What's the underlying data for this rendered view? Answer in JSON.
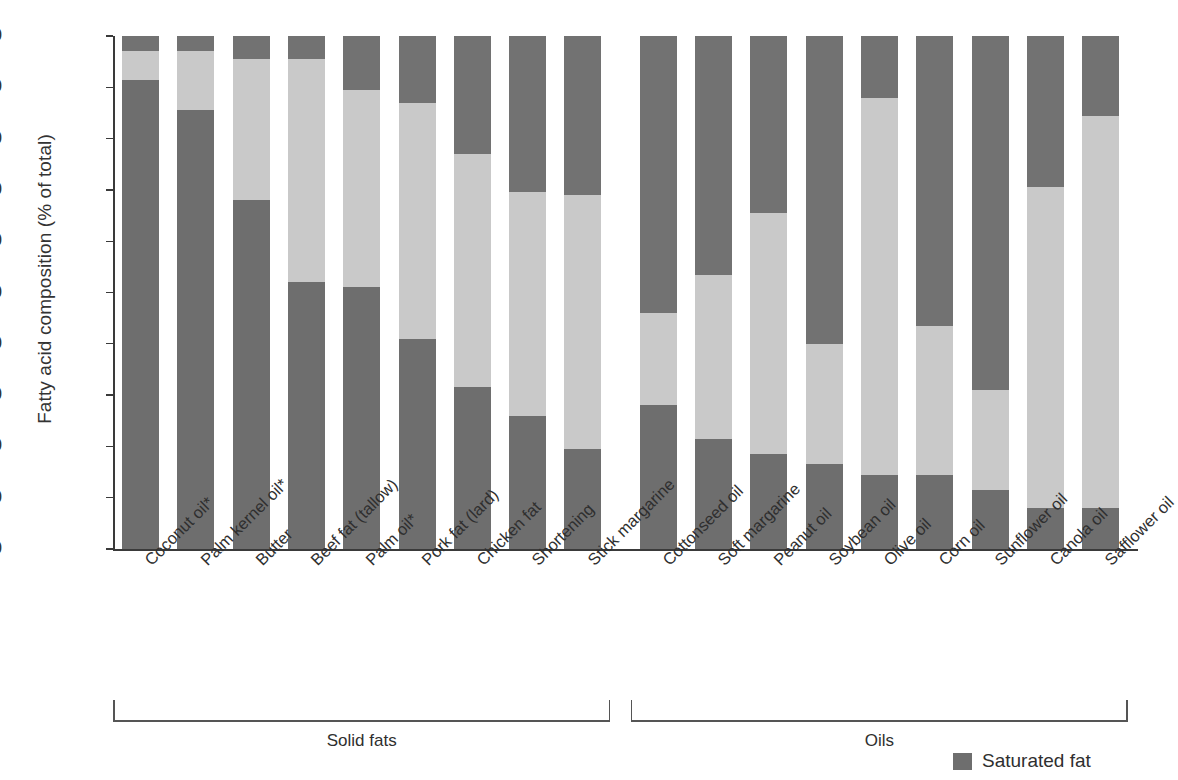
{
  "chart_data": {
    "type": "bar",
    "subtype": "stacked-bar-100",
    "title": "",
    "xlabel": "",
    "ylabel": "Fatty acid composition (% of total)",
    "ylim": [
      0,
      100
    ],
    "yticks": [
      0,
      10,
      20,
      30,
      40,
      50,
      60,
      70,
      80,
      90,
      100
    ],
    "ytick_labels": [
      "0",
      "10",
      "20",
      "30",
      "40",
      "50",
      "60",
      "70",
      "80",
      "90",
      "100"
    ],
    "grid": false,
    "legend_position": "bottom-right",
    "categories": [
      "Coconut oil*",
      "Palm kernel oil*",
      "Butter",
      "Beef fat (tallow)",
      "Palm oil*",
      "Pork fat (lard)",
      "Chicken fat",
      "Shortening",
      "Stick margarine",
      "Cottonseed oil",
      "Soft margarine",
      "Peanut oil",
      "Soybean oil",
      "Olive oil",
      "Corn oil",
      "Sunflower oil",
      "Canola oil",
      "Safflower oil"
    ],
    "series": [
      {
        "name": "Saturated fat",
        "color": "#6e6e6e",
        "values": [
          91.5,
          85.5,
          68,
          52,
          51,
          41,
          31.5,
          26,
          19.5,
          28,
          21.5,
          18.5,
          16.5,
          14.5,
          14.5,
          11.5,
          8,
          8
        ]
      },
      {
        "name": "Monounsaturated fat",
        "color": "#c9c9c9",
        "values": [
          5.5,
          11.5,
          27.5,
          43.5,
          38.5,
          46,
          45.5,
          43.5,
          49.5,
          18,
          32,
          47,
          23.5,
          73.5,
          29,
          19.5,
          62.5,
          76.5
        ]
      },
      {
        "name": "Polyunsaturated fat",
        "color": "#727272",
        "values": [
          3,
          3,
          4.5,
          4.5,
          10.5,
          13,
          23,
          30.5,
          31,
          54,
          46.5,
          34.5,
          60,
          12,
          56.5,
          69,
          29.5,
          15.5
        ]
      }
    ],
    "segment_boundaries_pct": {
      "note": "cumulative upper edge of saturated, then of saturated+mono",
      "sat_top": [
        91.5,
        85.5,
        68,
        52,
        51,
        41,
        31.5,
        26,
        19.5,
        28,
        21.5,
        18.5,
        16.5,
        14.5,
        14.5,
        11.5,
        8,
        8
      ],
      "mono_top": [
        97,
        97,
        95.5,
        95.5,
        89.5,
        87,
        77,
        69.5,
        69,
        46,
        53.5,
        65.5,
        40,
        88,
        43.5,
        31,
        70.5,
        84.5
      ]
    },
    "groups": [
      {
        "label": "Solid fats",
        "start_index": 0,
        "end_index": 8
      },
      {
        "label": "Oils",
        "start_index": 9,
        "end_index": 17
      }
    ],
    "legend": [
      {
        "label": "Saturated fat",
        "color": "#6e6e6e"
      }
    ],
    "footnote_marker": "*",
    "colors": {
      "saturated": "#6e6e6e",
      "monounsaturated": "#c9c9c9",
      "polyunsaturated": "#727272",
      "axis": "#3a3a3a",
      "text": "#2f2f2f",
      "background": "#ffffff"
    }
  }
}
